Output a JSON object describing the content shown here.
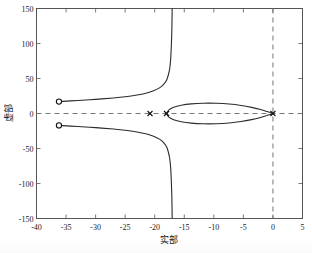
{
  "chart_data": {
    "type": "line",
    "title": "",
    "xlabel": "实部",
    "ylabel": "虚部",
    "xlim": [
      -40,
      5
    ],
    "ylim": [
      -150,
      150
    ],
    "xticks": [
      -40,
      -35,
      -30,
      -25,
      -20,
      -15,
      -10,
      -5,
      0,
      5
    ],
    "xticklabels": [
      "-40",
      "-35",
      "-30",
      "-25",
      "-20",
      "-15",
      "-10",
      "-5",
      "0",
      "5"
    ],
    "yticks": [
      -150,
      -100,
      -50,
      0,
      50,
      100,
      150
    ],
    "yticklabels": [
      "-150",
      "-100",
      "-50",
      "0",
      "50",
      "100",
      "150"
    ],
    "grid": false,
    "legend": "none",
    "reference_lines": [
      {
        "name": "real-axis",
        "orientation": "horizontal",
        "value": 0,
        "style": "dashed"
      },
      {
        "name": "imaginary-axis",
        "orientation": "vertical",
        "value": 0,
        "style": "dashed"
      }
    ],
    "markers": {
      "zeros": [
        {
          "label": "zero-upper",
          "x": -36.2,
          "y": 17
        },
        {
          "label": "zero-lower",
          "x": -36.2,
          "y": -17
        }
      ],
      "poles": [
        {
          "label": "pole-left",
          "x": -20.8,
          "y": 0
        },
        {
          "label": "pole-mid",
          "x": -18.0,
          "y": 0
        },
        {
          "label": "pole-origin",
          "x": 0.0,
          "y": 0
        }
      ]
    },
    "series": [
      {
        "name": "locus-oval",
        "comment": "closed oval loop between the pole at -18 and the pole at 0",
        "points": [
          [
            -18.0,
            0.0
          ],
          [
            -17.6,
            5.2
          ],
          [
            -16.8,
            9.0
          ],
          [
            -15.5,
            11.9
          ],
          [
            -13.8,
            13.8
          ],
          [
            -11.8,
            14.7
          ],
          [
            -9.6,
            14.6
          ],
          [
            -7.4,
            13.5
          ],
          [
            -5.4,
            11.5
          ],
          [
            -3.6,
            8.7
          ],
          [
            -2.1,
            5.6
          ],
          [
            -1.0,
            2.8
          ],
          [
            0.0,
            0.0
          ],
          [
            -1.0,
            -2.8
          ],
          [
            -2.1,
            -5.6
          ],
          [
            -3.6,
            -8.7
          ],
          [
            -5.4,
            -11.5
          ],
          [
            -7.4,
            -13.5
          ],
          [
            -9.6,
            -14.6
          ],
          [
            -11.8,
            -14.7
          ],
          [
            -13.8,
            -13.8
          ],
          [
            -15.5,
            -11.9
          ],
          [
            -16.8,
            -9.0
          ],
          [
            -17.6,
            -5.2
          ],
          [
            -18.0,
            0.0
          ]
        ]
      },
      {
        "name": "locus-branch-upper",
        "comment": "branch from zero at (-36.2, 17) rising to the vertical asymptote near Re = -17",
        "points": [
          [
            -36.2,
            17.0
          ],
          [
            -33.0,
            18.6
          ],
          [
            -30.0,
            20.2
          ],
          [
            -27.0,
            22.2
          ],
          [
            -25.0,
            23.9
          ],
          [
            -23.0,
            26.4
          ],
          [
            -21.5,
            29.0
          ],
          [
            -20.2,
            32.4
          ],
          [
            -19.2,
            36.6
          ],
          [
            -18.5,
            41.6
          ],
          [
            -18.0,
            47.5
          ],
          [
            -17.7,
            55.0
          ],
          [
            -17.45,
            65.0
          ],
          [
            -17.3,
            78.0
          ],
          [
            -17.2,
            95.0
          ],
          [
            -17.1,
            120.0
          ],
          [
            -17.05,
            150.0
          ]
        ]
      },
      {
        "name": "locus-branch-lower",
        "comment": "mirror branch from zero at (-36.2, -17) descending to the vertical asymptote near Re = -17",
        "points": [
          [
            -36.2,
            -17.0
          ],
          [
            -33.0,
            -18.6
          ],
          [
            -30.0,
            -20.2
          ],
          [
            -27.0,
            -22.2
          ],
          [
            -25.0,
            -23.9
          ],
          [
            -23.0,
            -26.4
          ],
          [
            -21.5,
            -29.0
          ],
          [
            -20.2,
            -32.4
          ],
          [
            -19.2,
            -36.6
          ],
          [
            -18.5,
            -41.6
          ],
          [
            -18.0,
            -47.5
          ],
          [
            -17.7,
            -55.0
          ],
          [
            -17.45,
            -65.0
          ],
          [
            -17.3,
            -78.0
          ],
          [
            -17.2,
            -95.0
          ],
          [
            -17.1,
            -120.0
          ],
          [
            -17.05,
            -150.0
          ]
        ]
      }
    ]
  },
  "colors": {
    "locus": "#2b2b2b",
    "frame": "#555555",
    "dashed": "#777777",
    "text": "#111111",
    "background": "#ffffff"
  }
}
